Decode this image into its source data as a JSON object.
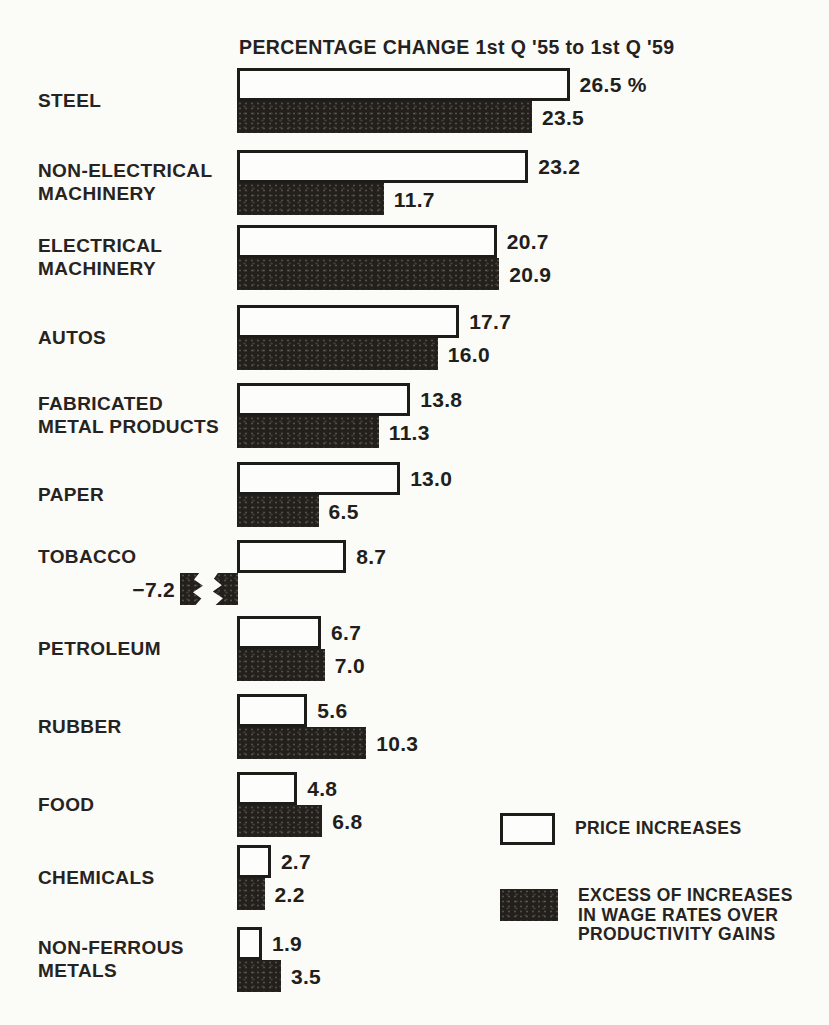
{
  "page": {
    "background": "#fbfbf8",
    "ink": "#1e1c19"
  },
  "chart_data": {
    "type": "bar",
    "orientation": "horizontal",
    "title": "PERCENTAGE CHANGE 1st Q '55 to 1st Q '59",
    "unit": "percent",
    "categories": [
      "STEEL",
      "NON-ELECTRICAL\nMACHINERY",
      "ELECTRICAL\nMACHINERY",
      "AUTOS",
      "FABRICATED\nMETAL PRODUCTS",
      "PAPER",
      "TOBACCO",
      "PETROLEUM",
      "RUBBER",
      "FOOD",
      "CHEMICALS",
      "NON-FERROUS\nMETALS"
    ],
    "series": [
      {
        "name": "PRICE INCREASES",
        "color": "#ffffff",
        "values": [
          26.5,
          23.2,
          20.7,
          17.7,
          13.8,
          13.0,
          8.7,
          6.7,
          5.6,
          4.8,
          2.7,
          1.9
        ],
        "labels": [
          "26.5 %",
          "23.2",
          "20.7",
          "17.7",
          "13.8",
          "13.0",
          "8.7",
          "6.7",
          "5.6",
          "4.8",
          "2.7",
          "1.9"
        ]
      },
      {
        "name": "EXCESS OF INCREASES IN WAGE RATES OVER PRODUCTIVITY GAINS",
        "color": "#23201c",
        "values": [
          23.5,
          11.7,
          20.9,
          16.0,
          11.3,
          6.5,
          -7.2,
          7.0,
          10.3,
          6.8,
          2.2,
          3.5
        ],
        "labels": [
          "23.5",
          "11.7",
          "20.9",
          "16.0",
          "11.3",
          "6.5",
          "−7.2",
          "7.0",
          "10.3",
          "6.8",
          "2.2",
          "3.5"
        ]
      }
    ],
    "annotations": {
      "negative_bar_note": "TOBACCO wage-excess bar is negative; drawn to the left of the axis with a break mark."
    },
    "legend_position": "bottom-right",
    "grid": false
  },
  "legend": {
    "items": [
      {
        "label": "PRICE INCREASES",
        "swatch": "white"
      },
      {
        "label": "EXCESS OF INCREASES\nIN WAGE RATES OVER\nPRODUCTIVITY GAINS",
        "swatch": "dark"
      }
    ]
  }
}
